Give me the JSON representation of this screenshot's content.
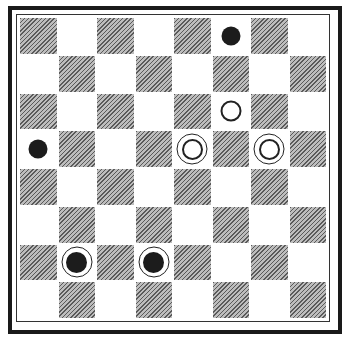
{
  "board": {
    "size": 8,
    "colors": {
      "dark_square": "#8a8a8a",
      "light_square": "#ffffff",
      "frame": "#1a1a1a",
      "piece_black": "#1c1c1c",
      "piece_white": "#ffffff"
    },
    "pieces": [
      {
        "row": 0,
        "col": 5,
        "type": "black-man"
      },
      {
        "row": 2,
        "col": 5,
        "type": "white-man"
      },
      {
        "row": 3,
        "col": 0,
        "type": "black-man"
      },
      {
        "row": 3,
        "col": 4,
        "type": "white-king"
      },
      {
        "row": 3,
        "col": 6,
        "type": "white-king"
      },
      {
        "row": 6,
        "col": 1,
        "type": "black-king"
      },
      {
        "row": 6,
        "col": 3,
        "type": "black-king"
      }
    ]
  }
}
